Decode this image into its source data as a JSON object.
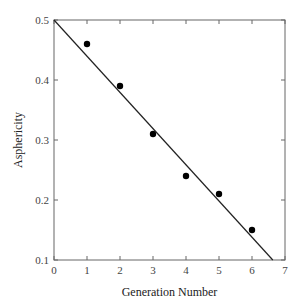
{
  "chart_data": {
    "type": "scatter",
    "title": "",
    "xlabel": "Generation Number",
    "ylabel": "Asphericity",
    "xlim": [
      0,
      7
    ],
    "ylim": [
      0.1,
      0.5
    ],
    "xticks": [
      0,
      1,
      2,
      3,
      4,
      5,
      6,
      7
    ],
    "yticks": [
      0.1,
      0.2,
      0.3,
      0.4,
      0.5
    ],
    "xtick_labels": [
      "0",
      "1",
      "2",
      "3",
      "4",
      "5",
      "6",
      "7"
    ],
    "ytick_labels": [
      "0.1",
      "0.2",
      "0.3",
      "0.4",
      "0.5"
    ],
    "grid": false,
    "legend": null,
    "series": [
      {
        "name": "data",
        "kind": "scatter",
        "marker": "filled-circle",
        "color": "#000000",
        "x": [
          1,
          2,
          3,
          4,
          5,
          6
        ],
        "y": [
          0.46,
          0.39,
          0.31,
          0.24,
          0.21,
          0.15
        ]
      },
      {
        "name": "linear fit",
        "kind": "line",
        "color": "#222222",
        "x": [
          0,
          6.63
        ],
        "y": [
          0.5,
          0.1
        ]
      }
    ]
  }
}
